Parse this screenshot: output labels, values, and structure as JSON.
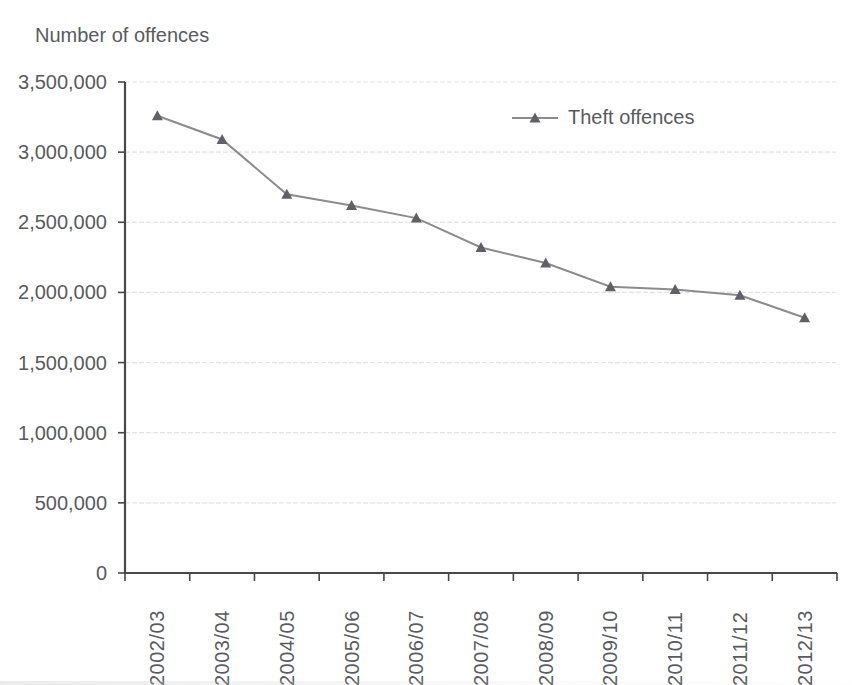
{
  "chart_data": {
    "type": "line",
    "title": "Number of offences",
    "categories": [
      "2002/03",
      "2003/04",
      "2004/05",
      "2005/06",
      "2006/07",
      "2007/08",
      "2008/09",
      "2009/10",
      "2010/11",
      "2011/12",
      "2012/13"
    ],
    "series": [
      {
        "name": "Theft offences",
        "marker": "triangle",
        "values": [
          3260000,
          3090000,
          2700000,
          2620000,
          2530000,
          2320000,
          2210000,
          2040000,
          2020000,
          1980000,
          1820000
        ]
      }
    ],
    "xlabel": "",
    "ylabel": "Number of offences",
    "ylim": [
      0,
      3500000
    ],
    "ytick_step": 500000,
    "ytick_labels": [
      "3,500,000",
      "3,000,000",
      "2,500,000",
      "2,000,000",
      "1,500,000",
      "1,000,000",
      "500,000",
      "0"
    ],
    "grid": "horizontal",
    "legend_position": "inside-top-right"
  },
  "colors": {
    "background": "#ffffff",
    "text": "#595b5e",
    "axis": "#47484a",
    "grid": "#e3e3e3",
    "line": "#8c8c8c",
    "marker": "#5f6167"
  }
}
